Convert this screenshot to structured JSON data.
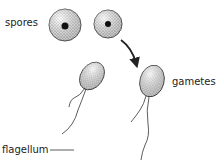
{
  "diagram": {
    "labels": {
      "spores": "spores",
      "gametes": "gametes",
      "flagellum": "flagellum"
    },
    "colors": {
      "ink": "#222222",
      "stipple": "#b8b8b8",
      "background": "#ffffff"
    }
  }
}
